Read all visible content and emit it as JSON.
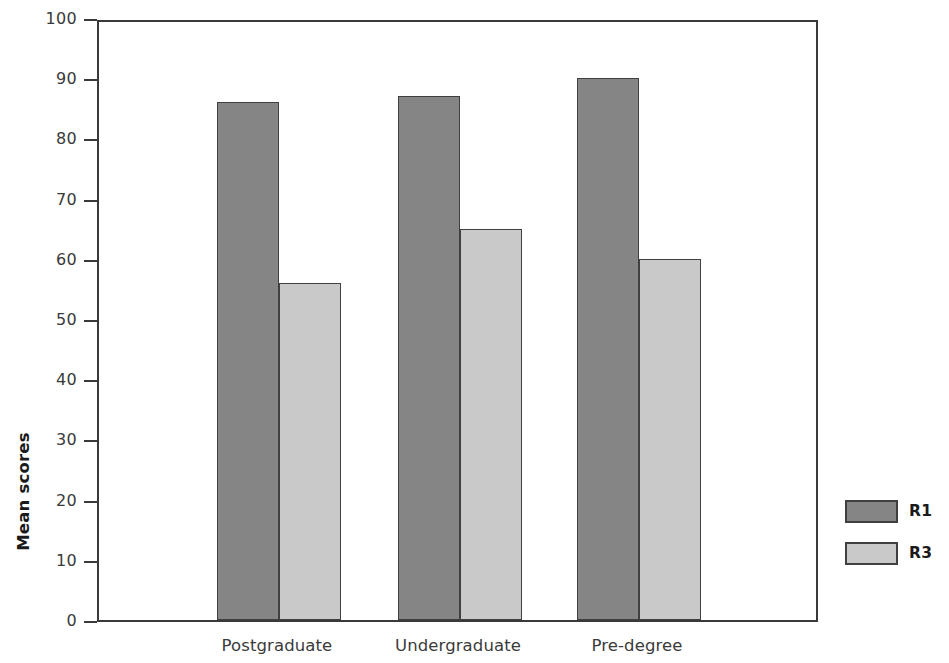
{
  "chart_data": {
    "type": "bar",
    "title": "",
    "xlabel": "",
    "ylabel": "Mean scores",
    "categories": [
      "Postgraduate",
      "Undergraduate",
      "Pre-degree"
    ],
    "series": [
      {
        "name": "R1",
        "color": "#858585",
        "values": [
          86,
          87,
          90
        ]
      },
      {
        "name": "R3",
        "color": "#c9c9c9",
        "values": [
          56,
          65,
          60
        ]
      }
    ],
    "ylim": [
      0,
      100
    ],
    "ytick_labels": [
      "0",
      "10",
      "20",
      "30",
      "40",
      "50",
      "60",
      "70",
      "80",
      "90",
      "100"
    ],
    "ytick_values": [
      0,
      10,
      20,
      30,
      40,
      50,
      60,
      70,
      80,
      90,
      100
    ],
    "grid": false,
    "legend_position": "right"
  },
  "legend": {
    "entries": [
      {
        "label": "R1",
        "swatch": "r1"
      },
      {
        "label": "R3",
        "swatch": "r3"
      }
    ]
  },
  "axis": {
    "y_title": "Mean scores"
  }
}
